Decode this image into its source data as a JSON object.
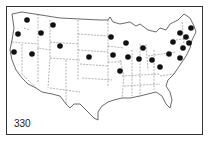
{
  "map": {
    "label": "330",
    "caption": "",
    "frame_color": "#333333",
    "dot_color": "#111111",
    "line_color": "#555555",
    "dots": [
      {
        "x": 27,
        "y": 20
      },
      {
        "x": 18,
        "y": 34
      },
      {
        "x": 41,
        "y": 33
      },
      {
        "x": 53,
        "y": 25
      },
      {
        "x": 14,
        "y": 52
      },
      {
        "x": 32,
        "y": 54
      },
      {
        "x": 60,
        "y": 46
      },
      {
        "x": 89,
        "y": 57
      },
      {
        "x": 111,
        "y": 37
      },
      {
        "x": 126,
        "y": 43
      },
      {
        "x": 113,
        "y": 55
      },
      {
        "x": 128,
        "y": 57
      },
      {
        "x": 143,
        "y": 48
      },
      {
        "x": 139,
        "y": 59
      },
      {
        "x": 152,
        "y": 60
      },
      {
        "x": 120,
        "y": 71
      },
      {
        "x": 160,
        "y": 67
      },
      {
        "x": 173,
        "y": 42
      },
      {
        "x": 180,
        "y": 33
      },
      {
        "x": 186,
        "y": 37
      },
      {
        "x": 191,
        "y": 28
      },
      {
        "x": 189,
        "y": 43
      },
      {
        "x": 183,
        "y": 48
      },
      {
        "x": 169,
        "y": 54
      },
      {
        "x": 180,
        "y": 58
      }
    ]
  }
}
